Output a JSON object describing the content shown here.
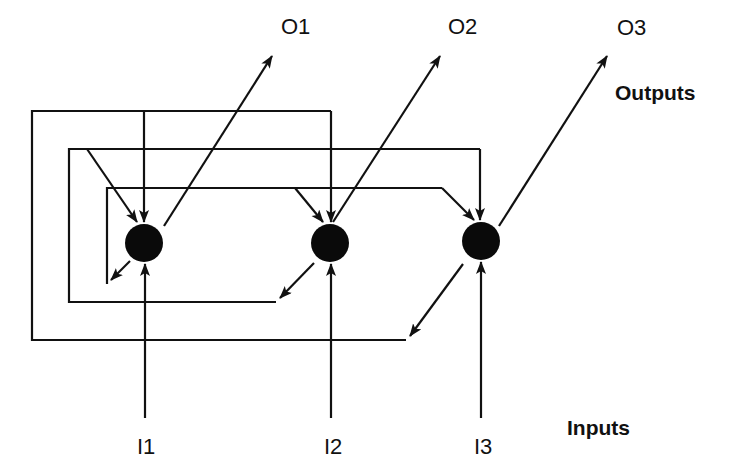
{
  "diagram": {
    "type": "recurrent-neural-network",
    "group_labels": {
      "outputs": "Outputs",
      "inputs": "Inputs"
    },
    "colors": {
      "stroke": "#111111",
      "node_fill": "#0a0a0a",
      "background": "#ffffff"
    },
    "nodes": [
      {
        "id": "n1",
        "cx": 144,
        "cy": 243,
        "r": 19
      },
      {
        "id": "n2",
        "cx": 330,
        "cy": 243,
        "r": 19
      },
      {
        "id": "n3",
        "cx": 481,
        "cy": 241,
        "r": 19
      }
    ],
    "inputs": [
      {
        "id": "I1",
        "label": "I1",
        "target": "n1"
      },
      {
        "id": "I2",
        "label": "I2",
        "target": "n2"
      },
      {
        "id": "I3",
        "label": "I3",
        "target": "n3"
      }
    ],
    "outputs": [
      {
        "id": "O1",
        "label": "O1",
        "source": "n1"
      },
      {
        "id": "O2",
        "label": "O2",
        "source": "n2"
      },
      {
        "id": "O3",
        "label": "O3",
        "source": "n3"
      }
    ],
    "feedback_edges": [
      {
        "from": "n1",
        "to": [
          "n1",
          "n2",
          "n3"
        ],
        "loop": "inner"
      },
      {
        "from": "n2",
        "to": [
          "n1",
          "n3"
        ],
        "loop": "middle"
      },
      {
        "from": "n3",
        "to": [
          "n1",
          "n2"
        ],
        "loop": "outer"
      }
    ]
  }
}
